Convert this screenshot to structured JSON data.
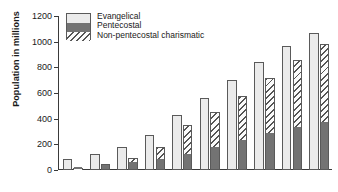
{
  "chart_data": {
    "type": "bar",
    "title": "",
    "xlabel": "",
    "ylabel": "Population in millions",
    "categories": [
      "1960",
      "1970",
      "1980",
      "1990",
      "2000",
      "2010",
      "2020",
      "2030",
      "2040",
      "2050"
    ],
    "ylim": [
      0,
      1200
    ],
    "yticks": [
      0,
      200,
      400,
      600,
      800,
      1000,
      1200
    ],
    "grid": false,
    "legend_position": "top-left",
    "series": [
      {
        "name": "Evangelical",
        "color": "#ebebeb",
        "values": [
          85,
          125,
          180,
          275,
          430,
          560,
          705,
          840,
          970,
          1065
        ]
      },
      {
        "name": "Pentecostal",
        "color": "#737373",
        "values": [
          15,
          35,
          55,
          80,
          115,
          175,
          228,
          280,
          330,
          370
        ]
      },
      {
        "name": "Non-pentecostal charismatic",
        "color": "hatched",
        "values": [
          3,
          8,
          35,
          100,
          235,
          280,
          350,
          435,
          525,
          615
        ]
      }
    ],
    "stacked_totals": [
      18,
      43,
      90,
      180,
      350,
      455,
      578,
      715,
      855,
      985
    ]
  },
  "legend": {
    "items": [
      {
        "label": "Evangelical"
      },
      {
        "label": "Pentecostal"
      },
      {
        "label": "Non-pentecostal charismatic"
      }
    ]
  }
}
